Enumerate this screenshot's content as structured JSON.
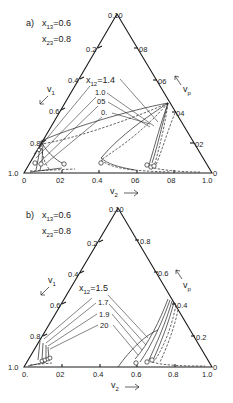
{
  "panels": [
    {
      "id": "a",
      "label": "a)",
      "params": [
        {
          "symbol": "x",
          "sub": "13",
          "value": "=0.6"
        },
        {
          "symbol": "x",
          "sub": "23",
          "value": "=0.8"
        }
      ],
      "series_label": {
        "symbol": "x",
        "sub": "12",
        "value": "=1.4"
      },
      "series_values": [
        "1.0",
        "05",
        "0."
      ],
      "top_vertex_label": "0.10",
      "left_axis": {
        "name": "v",
        "sub": "1",
        "ticks": [
          "0.2",
          "0.4",
          "0.6",
          "0.8"
        ],
        "corner": "1.0"
      },
      "right_axis": {
        "name": "v",
        "sub": "p",
        "ticks": [
          "08",
          "06",
          "04",
          "02"
        ],
        "corner": "0"
      },
      "bottom_axis": {
        "name": "v",
        "sub": "2",
        "ticks": [
          "0",
          "02",
          "0.4",
          "06",
          "08",
          "1.0"
        ]
      }
    },
    {
      "id": "b",
      "label": "b)",
      "params": [
        {
          "symbol": "x",
          "sub": "13",
          "value": "=0.6"
        },
        {
          "symbol": "x",
          "sub": "23",
          "value": "=0.8"
        }
      ],
      "series_label": {
        "symbol": "x",
        "sub": "12",
        "value": "=1.5"
      },
      "series_values": [
        "1.7",
        "1.9",
        "20"
      ],
      "top_vertex_label": "0.10",
      "left_axis": {
        "name": "v",
        "sub": "1",
        "ticks": [
          "0.2",
          "0.4",
          "0.6",
          "0.8"
        ],
        "corner": "1.0"
      },
      "right_axis": {
        "name": "v",
        "sub": "p",
        "ticks": [
          "0.8",
          "0.6",
          "0.4",
          "0.2"
        ],
        "corner": "0"
      },
      "bottom_axis": {
        "name": "v",
        "sub": "2",
        "ticks": [
          "0.",
          "02",
          "0.4",
          "0.6",
          "0.8",
          "1.0"
        ]
      }
    }
  ]
}
